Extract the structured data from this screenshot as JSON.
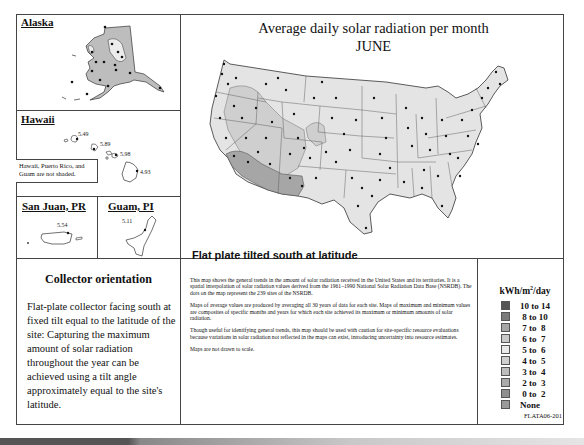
{
  "header": {
    "title": "Average daily solar radiation per month",
    "month": "JUNE"
  },
  "insets": {
    "alaska": {
      "title": "Alaska"
    },
    "hawaii": {
      "title": "Hawaii",
      "values": [
        "5.49",
        "5.89",
        "5.98",
        "4.93"
      ],
      "note": "Hawaii, Puerto Rico, and Guam are not shaded."
    },
    "san_juan": {
      "title": "San Juan, PR",
      "value": "5.54"
    },
    "guam": {
      "title": "Guam, PI",
      "value": "5.11"
    }
  },
  "map": {
    "caption": "Flat plate tilted south at latitude"
  },
  "collector": {
    "title": "Collector orientation",
    "body": "Flat-plate collector facing south at fixed tilt equal to the latitude of the site: Capturing the maximum amount of solar radiation throughout the year can be achieved using a tilt angle approximately equal to the site's latitude."
  },
  "description": {
    "paragraphs": [
      "This map shows the general trends in the amount of solar radiation received in the United States and its territories. It is a spatial interpolation of solar radiation values derived from the 1961–1990 National Solar Radiation Data Base (NSRDB). The dots on the map represent the 239 sites of the NSRDB.",
      "Maps of average values are produced by averaging all 30 years of data for each site. Maps of maximum and minimum values are composites of specific months and years for which each site achieved its maximum or minimum amounts of solar radiation.",
      "Though useful for identifying general trends, this map should be used with caution for site-specific resource evaluations because variations in solar radiation not reflected in the maps can exist, introducing uncertainty into resource estimates.",
      "Maps are not drawn to scale."
    ]
  },
  "legend": {
    "title_pre": "kWh/m",
    "title_sup": "2",
    "title_post": "/day",
    "items": [
      {
        "label": "10 to 14",
        "color": "#555555"
      },
      {
        "label": " 8 to 10",
        "color": "#7a7a7a"
      },
      {
        "label": " 7 to  8",
        "color": "#a6a6a6"
      },
      {
        "label": " 6 to  7",
        "color": "#c9c9c9"
      },
      {
        "label": " 5 to  6",
        "color": "#e9e9e9"
      },
      {
        "label": " 4 to  5",
        "color": "#cfcfcf"
      },
      {
        "label": " 3 to  4",
        "color": "#bdbdbd"
      },
      {
        "label": " 2 to  3",
        "color": "#aaaaaa"
      },
      {
        "label": " 0 to  2",
        "color": "#8f8f8f"
      },
      {
        "label": "None",
        "color": "#9a9a9a"
      }
    ]
  },
  "footer": {
    "code": "FLATA06-201"
  },
  "colors": {
    "zone_light": "#e6e6e6",
    "zone_mid": "#c9c9c9",
    "zone_dark": "#a6a6a6",
    "border": "#444444"
  }
}
